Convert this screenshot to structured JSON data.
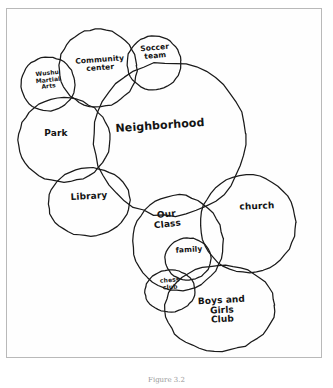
{
  "diagram": {
    "type": "venn-circles",
    "background_color": "#ffffff",
    "ink_color": "#1a1a1a",
    "frame_color": "#b9b9b9",
    "caption": "Figure 3.2",
    "circles": [
      {
        "id": "wushu-martial-arts",
        "label": "Wushu\nMartial\nArts",
        "cx": 48,
        "cy": 84,
        "rx": 27,
        "ry": 27,
        "rotate": -6,
        "label_x": 48,
        "label_y": 84,
        "size": "xs"
      },
      {
        "id": "community-center",
        "label": "Community\ncenter",
        "cx": 98,
        "cy": 68,
        "rx": 39,
        "ry": 39,
        "rotate": -4,
        "label_x": 100,
        "label_y": 70,
        "size": "sm"
      },
      {
        "id": "soccer-team",
        "label": "Soccer\nteam",
        "cx": 154,
        "cy": 63,
        "rx": 27,
        "ry": 27,
        "rotate": -5,
        "label_x": 155,
        "label_y": 58,
        "size": "sm"
      },
      {
        "id": "neighborhood",
        "label": "Neighborhood",
        "cx": 170,
        "cy": 139,
        "rx": 76,
        "ry": 77,
        "rotate": -4,
        "label_x": 160,
        "label_y": 134,
        "size": "lg"
      },
      {
        "id": "park",
        "label": "Park",
        "cx": 64,
        "cy": 140,
        "rx": 46,
        "ry": 42,
        "rotate": 0,
        "label_x": 56,
        "label_y": 143,
        "size": "md"
      },
      {
        "id": "library",
        "label": "Library",
        "cx": 89,
        "cy": 202,
        "rx": 41,
        "ry": 34,
        "rotate": -3,
        "label_x": 89,
        "label_y": 206,
        "size": "md"
      },
      {
        "id": "our-class",
        "label": "Our\nClass",
        "cx": 178,
        "cy": 243,
        "rx": 45,
        "ry": 48,
        "rotate": -6,
        "label_x": 167,
        "label_y": 224,
        "size": "md"
      },
      {
        "id": "family",
        "label": "family",
        "cx": 188,
        "cy": 259,
        "rx": 23,
        "ry": 21,
        "rotate": -3,
        "label_x": 189,
        "label_y": 260,
        "size": "sm"
      },
      {
        "id": "chess-club",
        "label": "chess\nclub",
        "cx": 170,
        "cy": 291,
        "rx": 25,
        "ry": 21,
        "rotate": -4,
        "label_x": 170,
        "label_y": 291,
        "size": "xs"
      },
      {
        "id": "church",
        "label": "church",
        "cx": 248,
        "cy": 224,
        "rx": 48,
        "ry": 49,
        "rotate": -2,
        "label_x": 257,
        "label_y": 216,
        "size": "md"
      },
      {
        "id": "boys-and-girls-club",
        "label": "Boys and\nGirls\nClub",
        "cx": 220,
        "cy": 308,
        "rx": 55,
        "ry": 43,
        "rotate": -3,
        "label_x": 222,
        "label_y": 310,
        "size": "md"
      }
    ]
  }
}
